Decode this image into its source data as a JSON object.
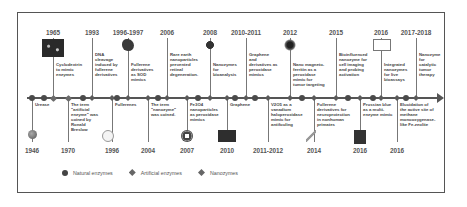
{
  "diagram": {
    "type": "timeline",
    "title": "",
    "top_events": [
      {
        "year": "1965",
        "x": 53,
        "text": "Cyclodextrin\nto mimic\nenzymes",
        "image": "cyclodextrin-micrograph",
        "category": "artificial"
      },
      {
        "year": "1993",
        "x": 92,
        "text": "DNA\ncleavage\ninduced by\nfullerene\nderivatives",
        "image": "",
        "category": "nano"
      },
      {
        "year": "1996-1997",
        "x": 128,
        "text": "Fullerene\nderivatives\nas SOD\nmimics",
        "image": "fullerene-derivative-blob",
        "category": "nano"
      },
      {
        "year": "2006",
        "x": 167,
        "text": "Rare earth\nnanoparticles\nprevented\nretinal\ndegeneration.",
        "image": "",
        "category": "nano"
      },
      {
        "year": "2008",
        "x": 210,
        "text": "Nanozymes\nfor\nbioanalysis",
        "image": "nanoparticle-schematic",
        "category": "nano"
      },
      {
        "year": "2010-2011",
        "x": 246,
        "text": "Graphene\nand\nderivatives as\nperoxidase\nmimics",
        "image": "",
        "category": "nano"
      },
      {
        "year": "2012",
        "x": 290,
        "text": "Nano magneto-\nferritin as a\nperoxidase\nmimic for\ntumor targeting",
        "image": "magnetoferritin-particle",
        "category": "nano"
      },
      {
        "year": "2015",
        "x": 336,
        "text": "Bioinfluenced\nnanozyme for\ncell imaging\nand probing\nactivation",
        "image": "",
        "category": "nano"
      },
      {
        "year": "2016",
        "x": 381,
        "text": "Integrated\nnanozymes\nfor live\nbioassays",
        "image": "integrated-nanozyme-panel",
        "category": "nano"
      },
      {
        "year": "2017-2018",
        "x": 416,
        "text": "Nanozyme\nfor\ncatalytic\ntumor\ntherapy",
        "image": "",
        "category": "nano"
      }
    ],
    "bottom_events": [
      {
        "year": "1946",
        "x": 32,
        "text": "Urease",
        "image": "urease-sphere",
        "category": "natural"
      },
      {
        "year": "1970",
        "x": 68,
        "text": "The term\n\"artificial\nenzyme\" was\ncoined by\nRonald\nBreslow",
        "image": "",
        "category": "artificial"
      },
      {
        "year": "1996",
        "x": 112,
        "text": "Fullerenes",
        "image": "fullerene-cage",
        "category": "nano"
      },
      {
        "year": "2004",
        "x": 148,
        "text": "The term\n\"nanozyme\"\nwas coined.",
        "image": "",
        "category": "nano"
      },
      {
        "year": "2007",
        "x": 187,
        "text": "Fe3O4\nnanoparticles\nas peroxidase\nmimics",
        "image": "fe3o4-nanoparticle",
        "category": "nano"
      },
      {
        "year": "2010",
        "x": 227,
        "text": "Graphene",
        "image": "graphene-sheet",
        "category": "nano"
      },
      {
        "year": "2011-2012",
        "x": 268,
        "text": "V2O5 as a\nvanadium\nhaloperoxidase\nmimic for\nantifouling",
        "image": "",
        "category": "nano"
      },
      {
        "year": "2014",
        "x": 314,
        "text": "Fullerene\nderivatives for\nneuroprotection\nin nonhuman\nprimates",
        "image": "primate-figure",
        "category": "nano"
      },
      {
        "year": "2016",
        "x": 360,
        "text": "Prussian blue\nas a multi-\nenzyme mimic",
        "image": "prussian-blue-image",
        "category": "nano"
      },
      {
        "year": "2016",
        "x": 397,
        "text": "Elucidation of\nthe active site of\nmethane\nmonooxygenase-\nlike Fe-zeolite",
        "image": "",
        "category": "nano"
      }
    ],
    "legend": [
      {
        "label": "Natural enzymes",
        "marker": "circle"
      },
      {
        "label": "Artificial enzymes",
        "marker": "diamond"
      },
      {
        "label": "Nanozymes",
        "marker": "diamond"
      }
    ],
    "colors": {
      "axis": "#555555",
      "text": "#444444",
      "year": "#555555",
      "frame": "#555555"
    }
  }
}
